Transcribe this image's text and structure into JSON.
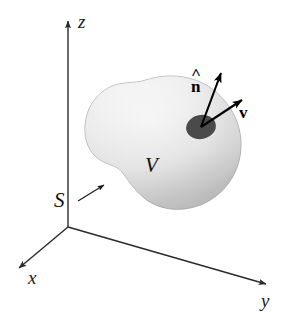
{
  "figure": {
    "kind": "3d-vector-field-diagram",
    "background_color": "#ffffff",
    "width": 283,
    "height": 321
  },
  "axes": {
    "origin": {
      "x": 68,
      "y": 227
    },
    "items": [
      {
        "name": "z",
        "label": "z",
        "tip": {
          "x": 68,
          "y": 15
        },
        "label_pos": {
          "x": 78,
          "y": 13
        }
      },
      {
        "name": "x",
        "label": "x",
        "tip": {
          "x": 14,
          "y": 272
        },
        "label_pos": {
          "x": 28,
          "y": 269
        }
      },
      {
        "name": "y",
        "label": "y",
        "tip": {
          "x": 272,
          "y": 286
        },
        "label_pos": {
          "x": 262,
          "y": 292
        }
      }
    ],
    "line_color": "#2a2a2a",
    "line_width": 1.4
  },
  "volume": {
    "label": "V",
    "label_pos": {
      "x": 148,
      "y": 163
    },
    "fill_light": "#fdfdfd",
    "fill_mid": "#e6e6e6",
    "fill_edge": "#b4b4b4",
    "outline_color": "#9a9a9a"
  },
  "surface": {
    "label": "S",
    "label_pos": {
      "x": 57,
      "y": 198
    },
    "leader_from": {
      "x": 78,
      "y": 200
    },
    "leader_to": {
      "x": 107,
      "y": 183
    },
    "line_color": "#1a1a1a"
  },
  "patch": {
    "name": "surface-element-patch",
    "center": {
      "x": 201,
      "y": 127
    },
    "rx": 15,
    "ry": 12,
    "rotation_deg": -12,
    "fill": "#4a4a4a"
  },
  "vectors": [
    {
      "name": "normal-vector",
      "label": "n",
      "accent": "hat",
      "from": {
        "x": 201,
        "y": 127
      },
      "to": {
        "x": 224,
        "y": 66
      },
      "label_pos": {
        "x": 193,
        "y": 77
      },
      "color": "#000000"
    },
    {
      "name": "velocity-vector",
      "label": "v",
      "accent": "bold",
      "from": {
        "x": 201,
        "y": 127
      },
      "to": {
        "x": 248,
        "y": 96
      },
      "label_pos": {
        "x": 240,
        "y": 105
      },
      "color": "#000000"
    }
  ]
}
